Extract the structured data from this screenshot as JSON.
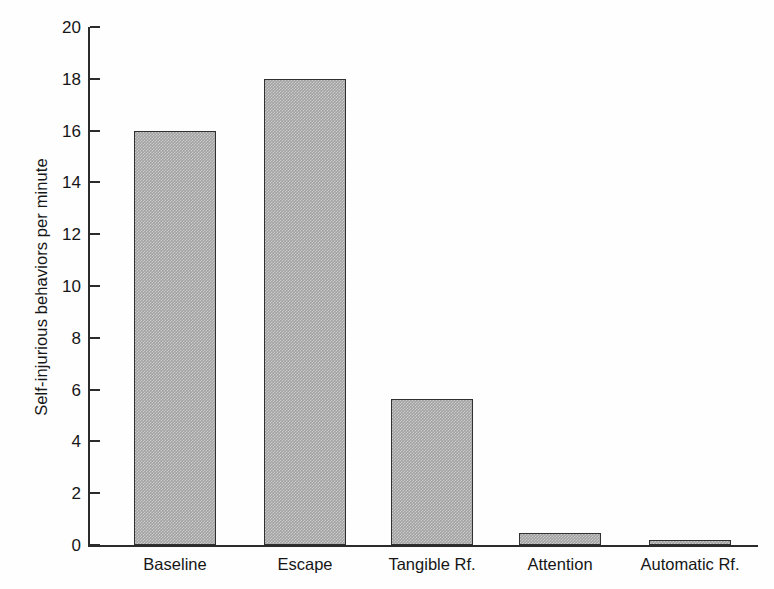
{
  "chart_data": {
    "type": "bar",
    "title": "",
    "subtitle": "",
    "xlabel": "",
    "ylabel": "Self-injurious behaviors per minute",
    "categories": [
      "Baseline",
      "Escape",
      "Tangible Rf.",
      "Attention",
      "Automatic Rf."
    ],
    "values": [
      16.0,
      18.0,
      5.65,
      0.45,
      0.2
    ],
    "ylim": [
      0,
      20
    ],
    "yticks": [
      0,
      2,
      4,
      6,
      8,
      10,
      12,
      14,
      16,
      18,
      20
    ],
    "ytick_labels": [
      "0",
      "2",
      "4",
      "6",
      "8",
      "10",
      "12",
      "14",
      "16",
      "18",
      "20"
    ],
    "grid": false,
    "legend": null,
    "legend_position": "none",
    "annotations": [],
    "bar_fill_color": "#a2a2a2",
    "bar_edge_color": "#303030",
    "axis_color": "#2b2b2b",
    "background_color": "#fefefe",
    "text_color": "#161616"
  }
}
